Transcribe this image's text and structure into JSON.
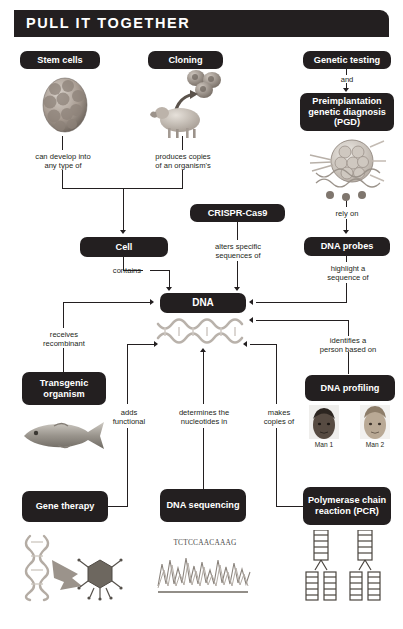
{
  "header": {
    "title": "PULL IT TOGETHER"
  },
  "nodes": [
    {
      "id": "stem-cells",
      "label": "Stem cells"
    },
    {
      "id": "cloning",
      "label": "Cloning"
    },
    {
      "id": "genetic-testing",
      "label": "Genetic testing"
    },
    {
      "id": "pgd",
      "label": "Preimplantation genetic diagnosis (PGD)"
    },
    {
      "id": "crispr-cas9",
      "label": "CRISPR-Cas9"
    },
    {
      "id": "cell",
      "label": "Cell"
    },
    {
      "id": "dna-probes",
      "label": "DNA probes"
    },
    {
      "id": "dna",
      "label": "DNA"
    },
    {
      "id": "transgenic",
      "label": "Transgenic organism"
    },
    {
      "id": "dna-profiling",
      "label": "DNA profiling"
    },
    {
      "id": "gene-therapy",
      "label": "Gene therapy"
    },
    {
      "id": "dna-sequencing",
      "label": "DNA sequencing"
    },
    {
      "id": "pcr",
      "label": "Polymerase chain reaction (PCR)"
    }
  ],
  "connectors": [
    {
      "id": "and",
      "label": "and"
    },
    {
      "id": "can-develop",
      "label": "can develop into\nany type of"
    },
    {
      "id": "produces-copies",
      "label": "produces copies\nof an organism's"
    },
    {
      "id": "rely-on",
      "label": "rely on"
    },
    {
      "id": "alters-specific",
      "label": "alters specific\nsequences of"
    },
    {
      "id": "contains",
      "label": "contains"
    },
    {
      "id": "highlight",
      "label": "highlight a\nsequence of"
    },
    {
      "id": "receives",
      "label": "receives\nrecombinant"
    },
    {
      "id": "identifies",
      "label": "identifies a\nperson based on"
    },
    {
      "id": "adds-functional",
      "label": "adds\nfunctional"
    },
    {
      "id": "determines",
      "label": "determines the\nnucleotides in"
    },
    {
      "id": "makes-copies",
      "label": "makes\ncopies of"
    }
  ],
  "captions": {
    "man1": "Man 1",
    "man2": "Man 2",
    "sequence_readout": "TCTCCAACAAAG"
  },
  "colors": {
    "node_fill": "#231f20",
    "node_text": "#ffffff",
    "page_bg": "#ffffff",
    "line": "#231f20"
  }
}
